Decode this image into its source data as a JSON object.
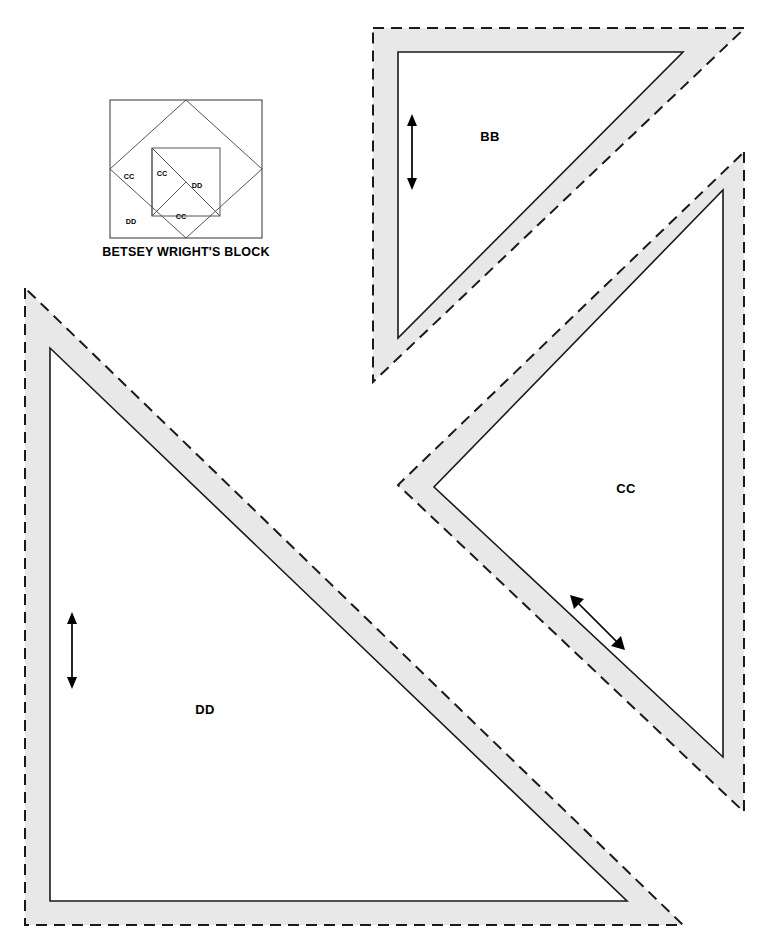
{
  "page": {
    "kind": "quilt-template-pattern-sheet",
    "width": 774,
    "height": 948,
    "background_color": "#ffffff"
  },
  "block_diagram": {
    "title": "BETSEY WRIGHT'S BLOCK",
    "frame_color": "#333333",
    "line_color": "#555555",
    "labels": [
      {
        "text": "CC",
        "x": 129,
        "y": 179
      },
      {
        "text": "CC",
        "x": 160,
        "y": 176
      },
      {
        "text": "DD",
        "x": 197,
        "y": 188
      },
      {
        "text": "DD",
        "x": 131,
        "y": 224
      },
      {
        "text": "CC",
        "x": 181,
        "y": 219
      }
    ]
  },
  "pieces": [
    {
      "id": "BB",
      "label": "BB",
      "label_x": 490,
      "label_y": 136,
      "seam_allowance_color": "#e8e8e8",
      "cut_line_style": "dashed",
      "sew_line_style": "solid",
      "grain_arrow": {
        "type": "double-headed",
        "direction": "vertical",
        "x1": 412,
        "y1": 116,
        "x2": 412,
        "y2": 188
      },
      "cut_points": "373,28 745,28 373,382",
      "sew_points": "398,52 683,52 398,338"
    },
    {
      "id": "CC",
      "label": "CC",
      "label_x": 626,
      "label_y": 488,
      "seam_allowance_color": "#e8e8e8",
      "cut_line_style": "dashed",
      "sew_line_style": "solid",
      "grain_arrow": {
        "type": "double-headed",
        "direction": "diagonal",
        "x1": 572,
        "y1": 597,
        "x2": 623,
        "y2": 648
      },
      "cut_points": "744,152 744,812 398,485",
      "sew_points": "723,190 723,757 434,487"
    },
    {
      "id": "DD",
      "label": "DD",
      "label_x": 205,
      "label_y": 709,
      "seam_allowance_color": "#e8e8e8",
      "cut_line_style": "dashed",
      "sew_line_style": "solid",
      "grain_arrow": {
        "type": "double-headed",
        "direction": "vertical",
        "x1": 72,
        "y1": 613,
        "x2": 72,
        "y2": 688
      },
      "cut_points": "25,288 25,925 683,925",
      "sew_points": "50,348 50,901 627,901"
    }
  ],
  "colors": {
    "seam_allowance": "#e8e8e8",
    "ink": "#1a1a1a",
    "paper": "#ffffff"
  }
}
